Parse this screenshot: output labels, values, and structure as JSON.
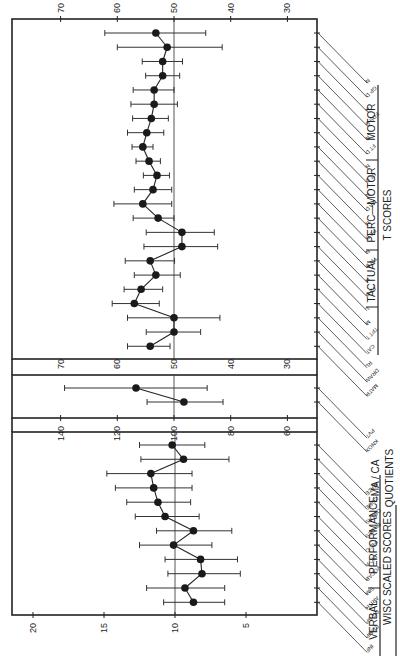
{
  "chart_data": [
    {
      "type": "scatter",
      "subtype": "dot-with-error-bars (rotated 90deg)",
      "title": "T SCORES",
      "axis": {
        "ticks": [
          70,
          60,
          50,
          40,
          30
        ],
        "reference_line": 50,
        "range": [
          76,
          26
        ]
      },
      "groups": [
        {
          "name": "MOTOR",
          "items": [
            "N",
            "GP D",
            "N",
            "FOS D",
            "N",
            "FT D",
            "N"
          ]
        },
        {
          "name": "PERC—MOTOR",
          "items": [
            "ST D",
            "N",
            "MA D",
            "N",
            "PS D",
            "N",
            "TW D"
          ]
        },
        {
          "name": "TACTUAL",
          "items": [
            "N",
            "FA D",
            "L"
          ]
        }
      ],
      "points": [
        {
          "label": "N",
          "value": 53.2,
          "low": 44.4,
          "high": 62.2
        },
        {
          "label": "GP D",
          "value": 51.2,
          "low": 41.5,
          "high": 60.0
        },
        {
          "label": "N",
          "value": 52.0,
          "low": 48.5,
          "high": 55.6
        },
        {
          "label": "FOS D",
          "value": 52.0,
          "low": 49.0,
          "high": 55.0
        },
        {
          "label": "N",
          "value": 53.5,
          "low": 50.0,
          "high": 57.2
        },
        {
          "label": "FT D",
          "value": 53.5,
          "low": 49.4,
          "high": 57.6
        },
        {
          "label": "N",
          "value": 54.0,
          "low": 51.0,
          "high": 57.3
        },
        {
          "label": "ST D",
          "value": 54.8,
          "low": 51.8,
          "high": 58.2
        },
        {
          "label": "N",
          "value": 55.5,
          "low": 53.7,
          "high": 57.4
        },
        {
          "label": "MA D",
          "value": 54.4,
          "low": 52.4,
          "high": 56.7
        },
        {
          "label": "N",
          "value": 53.0,
          "low": 50.8,
          "high": 55.4
        },
        {
          "label": "PS D",
          "value": 53.7,
          "low": 50.4,
          "high": 57.0
        },
        {
          "label": "N",
          "value": 55.5,
          "low": 50.4,
          "high": 60.6
        },
        {
          "label": "TW D",
          "value": 52.8,
          "low": 50.0,
          "high": 57.2
        },
        {
          "label": "N",
          "value": 48.6,
          "low": 42.9,
          "high": 54.9
        },
        {
          "label": "FA D",
          "value": 48.6,
          "low": 42.3,
          "high": 55.3
        },
        {
          "label": "L",
          "value": 54.2,
          "low": 49.9,
          "high": 58.6
        },
        {
          "label": "M",
          "value": 53.2,
          "low": 48.9,
          "high": 57.0
        },
        {
          "label": "TPT T",
          "value": 55.8,
          "low": 52.0,
          "high": 58.8
        },
        {
          "label": "CAT",
          "value": 57.0,
          "low": 52.6,
          "high": 60.9
        },
        {
          "label": "RL",
          "value": 50.0,
          "low": 41.9,
          "high": 58.2
        },
        {
          "label": "DRAW",
          "value": 50.0,
          "low": 45.3,
          "high": 54.9
        },
        {
          "label": "MATR",
          "value": 54.2,
          "low": 50.7,
          "high": 58.2
        }
      ]
    },
    {
      "type": "scatter",
      "subtype": "dot-with-error-bars (rotated 90deg)",
      "title": "MA / CA QUOTIENTS",
      "axis": {
        "ticks": [
          140,
          120,
          100,
          80,
          60
        ],
        "reference_line": 100,
        "range": [
          150,
          50
        ]
      },
      "points": [
        {
          "label": "PVT",
          "value": 113.4,
          "low": 88.3,
          "high": 138.6
        },
        {
          "label": "KNOX",
          "value": 96.5,
          "low": 82.7,
          "high": 109.5
        }
      ]
    },
    {
      "type": "scatter",
      "subtype": "dot-with-error-bars (rotated 90deg)",
      "title": "WISC SCALED SCORES",
      "axis": {
        "ticks": [
          20,
          15,
          10,
          5
        ],
        "reference_line": 10,
        "range": [
          22.1,
          1.5
        ]
      },
      "groups": [
        {
          "name": "VERBAL",
          "items": [
            "INF",
            "COMP",
            "DG SP",
            "ARITH",
            "SIM",
            "VOCAB"
          ]
        },
        {
          "name": "PERFORMANCE",
          "items": [
            "PIC A",
            "PIC C",
            "BL DES",
            "OBJ AS",
            "CODE",
            "MAZE"
          ]
        }
      ],
      "points": [
        {
          "label": "MAZE",
          "value": 10.2,
          "low": 7.9,
          "high": 12.5
        },
        {
          "label": "CODE",
          "value": 9.4,
          "low": 6.2,
          "high": 12.4
        },
        {
          "label": "OBJ AS",
          "value": 11.7,
          "low": 8.8,
          "high": 14.8
        },
        {
          "label": "BL DES",
          "value": 11.5,
          "low": 8.8,
          "high": 14.2
        },
        {
          "label": "PIC C",
          "value": 11.2,
          "low": 8.9,
          "high": 13.4
        },
        {
          "label": "PIC A",
          "value": 10.7,
          "low": 8.3,
          "high": 12.8
        },
        {
          "label": "VOCAB",
          "value": 8.7,
          "low": 6.0,
          "high": 11.3
        },
        {
          "label": "SIM",
          "value": 10.1,
          "low": 7.4,
          "high": 12.5
        },
        {
          "label": "ARITH",
          "value": 8.2,
          "low": 5.6,
          "high": 10.7
        },
        {
          "label": "DG SP",
          "value": 8.1,
          "low": 5.4,
          "high": 10.5
        },
        {
          "label": "COMP",
          "value": 9.3,
          "low": 6.5,
          "high": 12.0
        },
        {
          "label": "INF",
          "value": 8.7,
          "low": 6.5,
          "high": 10.8
        }
      ]
    }
  ],
  "labels": {
    "t_scores": "T SCORES",
    "motor": "MOTOR",
    "perc_motor": "PERC—MOTOR",
    "tactual": "TACTUAL",
    "ma_ca": "MA / CA",
    "quotients": "QUOTIENTS",
    "verbal": "VERBAL",
    "performance": "PERFORMANCE",
    "wisc": "WISC SCALED SCORES"
  }
}
